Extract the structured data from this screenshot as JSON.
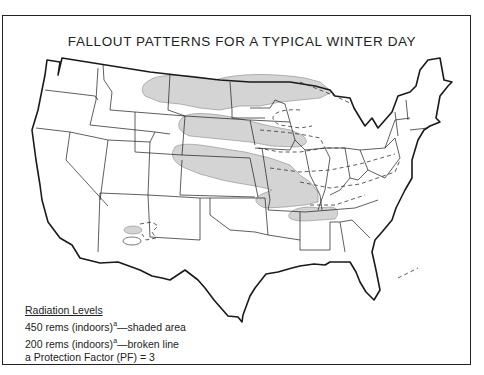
{
  "title": "FALLOUT PATTERNS FOR A TYPICAL WINTER DAY",
  "legend": {
    "heading": "Radiation Levels",
    "items": [
      {
        "value": "450 rems (indoors)",
        "superscript": "a",
        "desc": "—shaded area",
        "style": "shaded"
      },
      {
        "value": "200 rems (indoors)",
        "superscript": "a",
        "desc": "—broken line",
        "style": "dashed"
      }
    ],
    "footnote": "a Protection Factor (PF) = 3"
  },
  "map": {
    "region": "Contiguous United States",
    "shaded_color": "#d4d4d4",
    "line_color": "#1a1a1a",
    "shaded_regions": [
      "Montana-North Dakota-Minnesota band",
      "South Dakota-southern Minnesota plume",
      "Colorado-Nebraska-Kansas-Missouri band",
      "Tennessee-Arkansas-Kentucky plume",
      "Arizona twin ovals"
    ],
    "dashed_regions": [
      "Wisconsin-Minnesota loop",
      "Iowa-Illinois loop",
      "Midwest-Appalachian band to Virginia",
      "Tennessee-North Carolina band",
      "New Mexico loop",
      "Great Lakes northern line"
    ]
  }
}
